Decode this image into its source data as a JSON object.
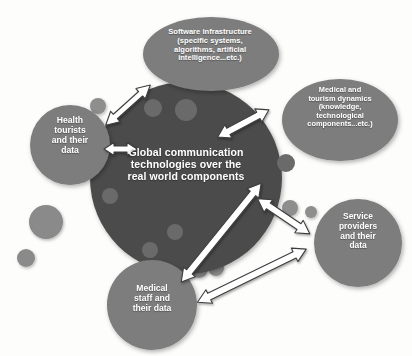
{
  "diagram": {
    "title_implicit": "Global communication technologies over the real world components",
    "background_color": "#fdfdfc",
    "core": {
      "id": "core-global-communication",
      "label": "Global communication\ntechnologies over the\nreal world components",
      "shape": "circle",
      "fill": "#4b4b4b",
      "cx": 186,
      "cy": 178,
      "r": 96
    },
    "nodes": [
      {
        "id": "node-software-infrastructure",
        "label": "Software infrastructure\n(specific systems,\nalgorithms, artificial\nintelligence...etc.)",
        "shape": "ellipse",
        "fill": "#7d7d7d",
        "cx": 211,
        "cy": 54,
        "rx": 68,
        "ry": 37
      },
      {
        "id": "node-medical-tourism-dynamics",
        "label": "Medical and\ntourism dynamics\n(knowledge,\ntechnological\ncomponents...etc.)",
        "shape": "ellipse",
        "fill": "#7d7d7d",
        "cx": 340,
        "cy": 120,
        "rx": 58,
        "ry": 41
      },
      {
        "id": "node-health-tourists",
        "label": "Health\ntourists\nand their\ndata",
        "shape": "circle",
        "fill": "#7d7d7d",
        "cx": 70,
        "cy": 145,
        "r": 40
      },
      {
        "id": "node-service-providers",
        "label": "Service\nproviders\nand their\ndata",
        "shape": "circle",
        "fill": "#7d7d7d",
        "cx": 358,
        "cy": 243,
        "r": 44
      },
      {
        "id": "node-medical-staff",
        "label": "Medical\nstaff and\ntheir data",
        "shape": "circle",
        "fill": "#7d7d7d",
        "cx": 152,
        "cy": 305,
        "r": 45
      }
    ],
    "connectors": [
      {
        "id": "connector-core-software",
        "from": "core-global-communication",
        "to": "node-software-infrastructure",
        "style": "double-headed-arrow",
        "fill": "#ffffff",
        "stroke": "#3d3d3d"
      },
      {
        "id": "connector-core-health-tourists",
        "from": "core-global-communication",
        "to": "node-health-tourists",
        "style": "double-headed-arrow",
        "fill": "#ffffff",
        "stroke": "#3d3d3d"
      },
      {
        "id": "connector-core-medical-tourism",
        "from": "core-global-communication",
        "to": "node-medical-tourism-dynamics",
        "style": "double-headed-arrow",
        "fill": "#ffffff",
        "stroke": "#3d3d3d"
      },
      {
        "id": "connector-core-service-providers",
        "from": "core-global-communication",
        "to": "node-service-providers",
        "style": "double-headed-arrow",
        "fill": "#ffffff",
        "stroke": "#3d3d3d"
      },
      {
        "id": "connector-medical-staff-medical-tourism",
        "from": "node-medical-staff",
        "to": "node-medical-tourism-dynamics",
        "style": "double-headed-arrow",
        "fill": "#ffffff",
        "stroke": "#3d3d3d"
      },
      {
        "id": "connector-medical-staff-service-providers",
        "from": "node-medical-staff",
        "to": "node-service-providers",
        "style": "double-headed-arrow",
        "fill": "#ffffff",
        "stroke": "#3d3d3d"
      }
    ],
    "decorative_dots": [
      {
        "cx": 98,
        "cy": 106,
        "r": 8,
        "fill": "#8e8e8e"
      },
      {
        "cx": 153,
        "cy": 108,
        "r": 9,
        "fill": "#6a6a6a"
      },
      {
        "cx": 186,
        "cy": 110,
        "r": 11,
        "fill": "#6a6a6a"
      },
      {
        "cx": 110,
        "cy": 196,
        "r": 8,
        "fill": "#6a6a6a"
      },
      {
        "cx": 175,
        "cy": 232,
        "r": 8,
        "fill": "#6a6a6a"
      },
      {
        "cx": 150,
        "cy": 250,
        "r": 8,
        "fill": "#6a6a6a"
      },
      {
        "cx": 264,
        "cy": 141,
        "r": 9,
        "fill": "#8a8a8a"
      },
      {
        "cx": 286,
        "cy": 163,
        "r": 9,
        "fill": "#6a6a6a"
      },
      {
        "cx": 290,
        "cy": 208,
        "r": 8,
        "fill": "#8e8e8e"
      },
      {
        "cx": 311,
        "cy": 212,
        "r": 6,
        "fill": "#8e8e8e"
      },
      {
        "cx": 199,
        "cy": 269,
        "r": 9,
        "fill": "#8a8a8a"
      },
      {
        "cx": 216,
        "cy": 268,
        "r": 8,
        "fill": "#8a8a8a"
      },
      {
        "cx": 46,
        "cy": 222,
        "r": 17,
        "fill": "#8a8a8a"
      },
      {
        "cx": 26,
        "cy": 258,
        "r": 9,
        "fill": "#8a8a8a"
      }
    ]
  }
}
